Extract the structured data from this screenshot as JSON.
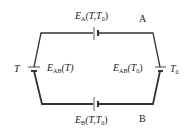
{
  "diagram": {
    "type": "thermocouple-circuit",
    "colors": {
      "wire": "#333333",
      "text": "#222222",
      "background": "#ffffff"
    },
    "nodes": {
      "A": {
        "label": "A"
      },
      "B": {
        "label": "B"
      },
      "hot_junction": {
        "label": "T"
      },
      "cold_junction": {
        "label": "T",
        "sub": "0"
      }
    },
    "edges": [
      {
        "name": "top-emf",
        "E": "E",
        "sub": "A",
        "args": "(T,T",
        "args_sub": "0",
        "args_end": ")"
      },
      {
        "name": "bottom-emf",
        "E": "E",
        "sub": "B",
        "args": "(T,T",
        "args_sub": "0",
        "args_end": ")"
      },
      {
        "name": "left-junction-emf",
        "E": "E",
        "sub": "AB",
        "args": "(T)"
      },
      {
        "name": "right-junction-emf",
        "E": "E",
        "sub": "AB",
        "args": "(T",
        "args_sub": "0",
        "args_end": ")"
      }
    ]
  }
}
